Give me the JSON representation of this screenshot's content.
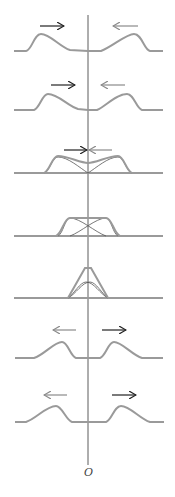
{
  "diagram": {
    "origin_label": "O",
    "axis": {
      "x": 88,
      "y_top": 15,
      "y_bottom": 465,
      "color": "#333333"
    },
    "colors": {
      "pulse": "#9a9a9a",
      "component": "#555555",
      "arrow_dark": "#222222",
      "arrow_light": "#8a8a8a"
    },
    "frames": [
      {
        "id": 1,
        "stage": "approaching",
        "baseline_y": 51,
        "arrows": [
          {
            "dir": "right",
            "x1": 40,
            "x2": 64,
            "y": 26,
            "shade": "dark"
          },
          {
            "dir": "left",
            "x1": 138,
            "x2": 113,
            "y": 26,
            "shade": "light"
          }
        ]
      },
      {
        "id": 2,
        "stage": "approaching closer",
        "baseline_y": 110,
        "arrows": [
          {
            "dir": "right",
            "x1": 51,
            "x2": 75,
            "y": 85,
            "shade": "dark"
          },
          {
            "dir": "left",
            "x1": 125,
            "x2": 101,
            "y": 85,
            "shade": "light"
          }
        ]
      },
      {
        "id": 3,
        "stage": "beginning overlap",
        "baseline_y": 173,
        "arrows": [
          {
            "dir": "right",
            "x1": 64,
            "x2": 87,
            "y": 150,
            "shade": "dark"
          },
          {
            "dir": "left",
            "x1": 112,
            "x2": 89,
            "y": 150,
            "shade": "light"
          }
        ]
      },
      {
        "id": 4,
        "stage": "half overlap",
        "baseline_y": 236
      },
      {
        "id": 5,
        "stage": "full overlap",
        "baseline_y": 298
      },
      {
        "id": 6,
        "stage": "separating",
        "baseline_y": 358,
        "arrows": [
          {
            "dir": "left",
            "x1": 76,
            "x2": 53,
            "y": 330,
            "shade": "light"
          },
          {
            "dir": "right",
            "x1": 102,
            "x2": 126,
            "y": 330,
            "shade": "dark"
          }
        ]
      },
      {
        "id": 7,
        "stage": "separated",
        "baseline_y": 422,
        "arrows": [
          {
            "dir": "left",
            "x1": 67,
            "x2": 44,
            "y": 395,
            "shade": "light"
          },
          {
            "dir": "right",
            "x1": 112,
            "x2": 136,
            "y": 395,
            "shade": "dark"
          }
        ]
      }
    ]
  }
}
